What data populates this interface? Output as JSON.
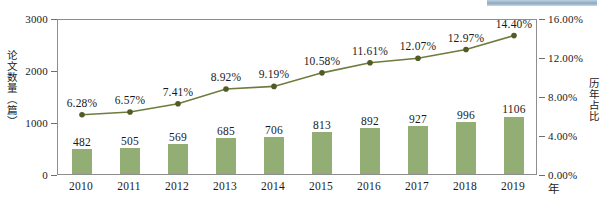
{
  "chart_data": {
    "type": "bar",
    "title": "",
    "subtitle": "",
    "xlabel": "年",
    "ylabel": "论文数量（篇）",
    "y2label": "历年占比",
    "categories": [
      "2010",
      "2011",
      "2012",
      "2013",
      "2014",
      "2015",
      "2016",
      "2017",
      "2018",
      "2019"
    ],
    "series": [
      {
        "name": "论文数量（篇）",
        "type": "bar",
        "axis": "left",
        "color": "#93ae75",
        "values": [
          482,
          505,
          569,
          685,
          706,
          813,
          892,
          927,
          996,
          1106
        ],
        "labels": [
          "482",
          "505",
          "569",
          "685",
          "706",
          "813",
          "892",
          "927",
          "996",
          "1106"
        ]
      },
      {
        "name": "历年占比",
        "type": "line",
        "axis": "right",
        "color": "#6d7c3c",
        "marker_color": "#4f5c26",
        "values": [
          6.28,
          6.57,
          7.41,
          8.92,
          9.19,
          10.58,
          11.61,
          12.07,
          12.97,
          14.4
        ],
        "labels": [
          "6.28%",
          "6.57%",
          "7.41%",
          "8.92%",
          "9.19%",
          "10.58%",
          "11.61%",
          "12.07%",
          "12.97%",
          "14.40%"
        ]
      }
    ],
    "y_left_ticks": [
      "0",
      "1000",
      "2000",
      "3000"
    ],
    "y_left_values": [
      0,
      1000,
      2000,
      3000
    ],
    "ylim": [
      0,
      3000
    ],
    "y_right_ticks": [
      "0.00%",
      "4.00%",
      "8.00%",
      "12.00%",
      "16.00%"
    ],
    "y_right_values": [
      0,
      4,
      8,
      12,
      16
    ],
    "y2lim": [
      0,
      16
    ],
    "grid": false,
    "legend": "none",
    "frame": true
  },
  "artifact": {
    "scan_strip_color": "#8da9c0"
  }
}
